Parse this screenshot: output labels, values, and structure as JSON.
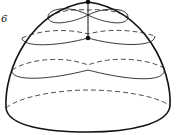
{
  "figure": {
    "type": "dome-with-level-curves",
    "label": "6",
    "label_pos": {
      "x": 1,
      "y": 13
    },
    "stroke_color": "#111111",
    "background": "#ffffff"
  },
  "points": [
    {
      "name": "top-point",
      "x": 88,
      "y": 2
    },
    {
      "name": "saddle-point",
      "x": 88,
      "y": 38
    }
  ],
  "curves": {
    "outline": "M6,108 C4,70 30,10 88,2 C146,10 172,70 170,106 C168,124 130,132 88,132 C46,132 8,126 6,108 Z",
    "vertical_segment": "M88,2 L88,38",
    "level_1_solid": "M88,15 C70,5 48,8 48,17 C48,26 70,24 88,15 C106,6 128,8 128,17 C128,26 106,24 88,15 Z",
    "level_1_dashed": "M48,17 C60,10 76,9 88,10 C100,9 116,10 128,17",
    "level_2_solid": "M22,38 C22,48 60,46 88,38 C116,46 155,48 155,36",
    "level_2_dashed": "M22,38 C40,30 66,28 88,34 C110,28 136,30 155,36",
    "level_3_dashed": "M12,70 C30,58 66,56 88,65 C110,56 146,58 164,68",
    "level_3_solid": "M12,70 C10,82 50,80 88,70 C126,80 168,84 164,68",
    "base_dashed": "M6,108 C20,96 60,90 88,90 C120,90 158,96 170,106"
  }
}
